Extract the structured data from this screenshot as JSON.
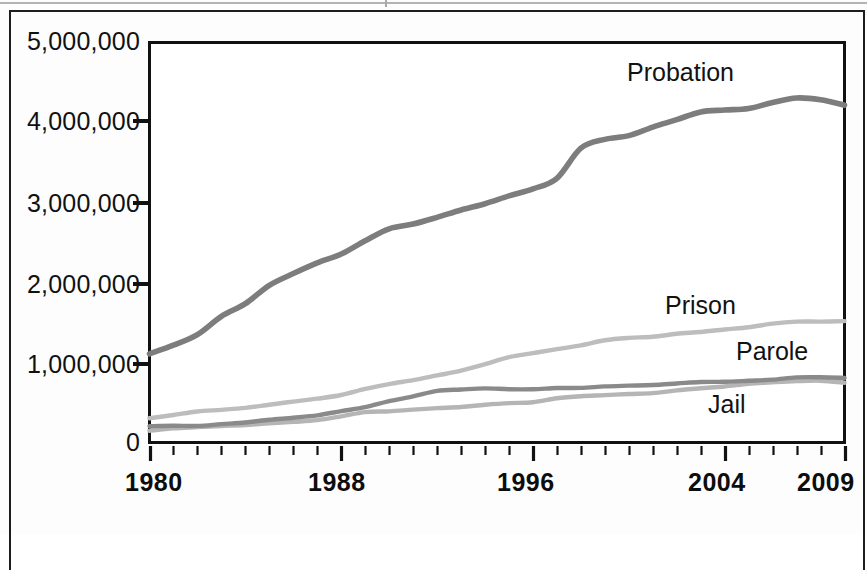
{
  "chart_data": {
    "type": "line",
    "title": "",
    "xlabel": "",
    "ylabel": "",
    "xlim": [
      1980,
      2009
    ],
    "ylim": [
      0,
      5000000
    ],
    "grid": true,
    "legend_position": "inline-right-of-line-ends",
    "y_ticks": [
      "0",
      "1,000,000",
      "2,000,000",
      "3,000,000",
      "4,000,000",
      "5,000,000"
    ],
    "y_tick_values": [
      0,
      1000000,
      2000000,
      3000000,
      4000000,
      5000000
    ],
    "x_ticks": [
      "1980",
      "1988",
      "1996",
      "2004",
      "2009"
    ],
    "x_tick_values": [
      1980,
      1988,
      1996,
      2004,
      2009
    ],
    "x_minor_tick_interval": 1,
    "x": [
      1980,
      1981,
      1982,
      1983,
      1984,
      1985,
      1986,
      1987,
      1988,
      1989,
      1990,
      1991,
      1992,
      1993,
      1994,
      1995,
      1996,
      1997,
      1998,
      1999,
      2000,
      2001,
      2002,
      2003,
      2004,
      2005,
      2006,
      2007,
      2008,
      2009
    ],
    "series": [
      {
        "name": "Probation",
        "color": "#7d7d7d",
        "values": [
          1118097,
          1225934,
          1357264,
          1582947,
          1740948,
          1968712,
          2114621,
          2247158,
          2356483,
          2522125,
          2670234,
          2728472,
          2811611,
          2903061,
          2981022,
          3077861,
          3164996,
          3296513,
          3670441,
          3779922,
          3826209,
          3931731,
          4024067,
          4120012,
          4143792,
          4162536,
          4236800,
          4293163,
          4270917,
          4203967
        ]
      },
      {
        "name": "Prison",
        "color": "#bdbdbd",
        "values": [
          319598,
          360029,
          402914,
          423898,
          448264,
          487593,
          526436,
          562814,
          607766,
          683367,
          743382,
          792535,
          850566,
          909381,
          990147,
          1078542,
          1127528,
          1176564,
          1224469,
          1287172,
          1316333,
          1330007,
          1367547,
          1390279,
          1421345,
          1448344,
          1492973,
          1517867,
          1518559,
          1524513
        ]
      },
      {
        "name": "Parole",
        "color": "#8a8a8a",
        "values": [
          220438,
          225539,
          224604,
          246440,
          266992,
          300203,
          325638,
          355505,
          407977,
          456803,
          531407,
          590442,
          658601,
          676100,
          690371,
          679421,
          679733,
          694787,
          696385,
          714457,
          723898,
          732333,
          750934,
          769925,
          771852,
          784408,
          798202,
          826097,
          828169,
          819308
        ]
      },
      {
        "name": "Jail",
        "color": "#b5b5b5",
        "values": [
          163994,
          195085,
          209582,
          223551,
          234500,
          256615,
          274444,
          295873,
          343569,
          395553,
          405320,
          426479,
          444584,
          459804,
          486474,
          507044,
          518492,
          567079,
          592462,
          605943,
          621149,
          631240,
          665475,
          691301,
          713990,
          747529,
          765819,
          780174,
          785533,
          760400
        ]
      }
    ]
  },
  "axis": {
    "y_labels": [
      {
        "text": "5,000,000",
        "value": 5000000
      },
      {
        "text": "4,000,000",
        "value": 4000000
      },
      {
        "text": "3,000,000",
        "value": 3000000
      },
      {
        "text": "2,000,000",
        "value": 2000000
      },
      {
        "text": "1,000,000",
        "value": 1000000
      },
      {
        "text": "0",
        "value": 0
      }
    ],
    "x_labels": [
      {
        "text": "1980",
        "value": 1980
      },
      {
        "text": "1988",
        "value": 1988
      },
      {
        "text": "1996",
        "value": 1996
      },
      {
        "text": "2004",
        "value": 2004
      },
      {
        "text": "2009",
        "value": 2009
      }
    ]
  },
  "series_labels": [
    {
      "text": "Probation"
    },
    {
      "text": "Prison"
    },
    {
      "text": "Parole"
    },
    {
      "text": "Jail"
    }
  ],
  "colors": {
    "probation": "#7d7d7d",
    "prison": "#bdbdbd",
    "parole": "#8a8a8a",
    "jail": "#b5b5b5",
    "axis": "#111111",
    "grid": "#c9c9c9",
    "background": "#ffffff"
  }
}
